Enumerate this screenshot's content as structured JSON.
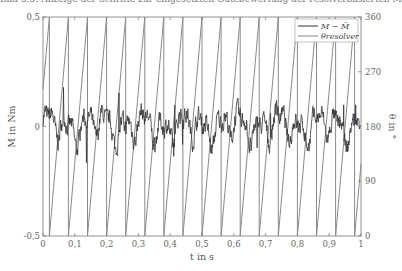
{
  "caption": "Bild 5.5: Anzeige der Schritte zur eingesetzten Gütebewertung der resolverbasierten Messung",
  "chart_data": {
    "type": "line",
    "title": "",
    "xlabel": "t in s",
    "ylabel_left": "M in Nm",
    "ylabel_right": "θ in °",
    "xlim": [
      0,
      1
    ],
    "ylim_left": [
      -0.5,
      0.5
    ],
    "ylim_right": [
      0,
      360
    ],
    "x_ticks": [
      "0",
      "0,1",
      "0,2",
      "0,3",
      "0,4",
      "0,5",
      "0,6",
      "0,7",
      "0,8",
      "0,9",
      "1"
    ],
    "y_ticks_left": [
      "-0,5",
      "0",
      "0,5"
    ],
    "y_ticks_right": [
      "0",
      "90",
      "180",
      "270",
      "360"
    ],
    "grid": false,
    "legend_position": "upper right",
    "series": [
      {
        "name": "M − M̄",
        "axis": "left",
        "description": "noisy torque deviation centered at 0 Nm, amplitude about ±0.1 Nm with spikes to about ±0.2 Nm",
        "mean": 0,
        "amplitude": 0.1
      },
      {
        "name": "θ_resolver",
        "axis": "right",
        "description": "sawtooth angle ramp 0 to 360°, wrapping about 17 times over 1 s",
        "period_s": 0.0606,
        "wrap_times_s": [
          0.02,
          0.08,
          0.14,
          0.2,
          0.26,
          0.32,
          0.38,
          0.44,
          0.5,
          0.56,
          0.62,
          0.68,
          0.74,
          0.8,
          0.86,
          0.92,
          0.98
        ],
        "min": 0,
        "max": 360
      }
    ]
  },
  "legend": {
    "items": [
      {
        "label": "M − M̄",
        "color": "#333333"
      },
      {
        "label": "θresolver",
        "color": "#888888"
      }
    ]
  },
  "colors": {
    "torque": "#333333",
    "angle": "#8a8a8a",
    "axis": "#777777"
  }
}
